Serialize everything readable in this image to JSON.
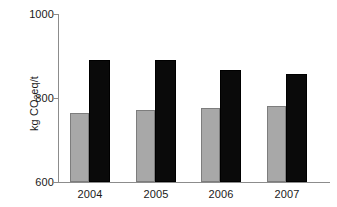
{
  "chart_data": {
    "type": "bar",
    "title": "",
    "subtitle": "",
    "xlabel": "",
    "ylabel": "kg CO2eq/t",
    "ylabel_parts": {
      "prefix": "kg CO",
      "sub": "2",
      "suffix": "eq/t"
    },
    "categories": [
      "2004",
      "2005",
      "2006",
      "2007"
    ],
    "series": [
      {
        "name": "grey-series",
        "color": "#a8a8a8",
        "values": [
          765,
          772,
          776,
          782
        ]
      },
      {
        "name": "black-series",
        "color": "#0a0a0a",
        "values": [
          890,
          890,
          867,
          857
        ]
      }
    ],
    "ylim": [
      600,
      1000
    ],
    "yticks": [
      600,
      800,
      1000
    ],
    "ytick_labels": [
      "600",
      "800",
      "1000"
    ],
    "grid": false,
    "legend": "none",
    "annotations": []
  },
  "axis": {
    "y_tick_labels": [
      "1000",
      "800",
      "600"
    ],
    "x_tick_labels": [
      "2004",
      "2005",
      "2006",
      "2007"
    ]
  }
}
